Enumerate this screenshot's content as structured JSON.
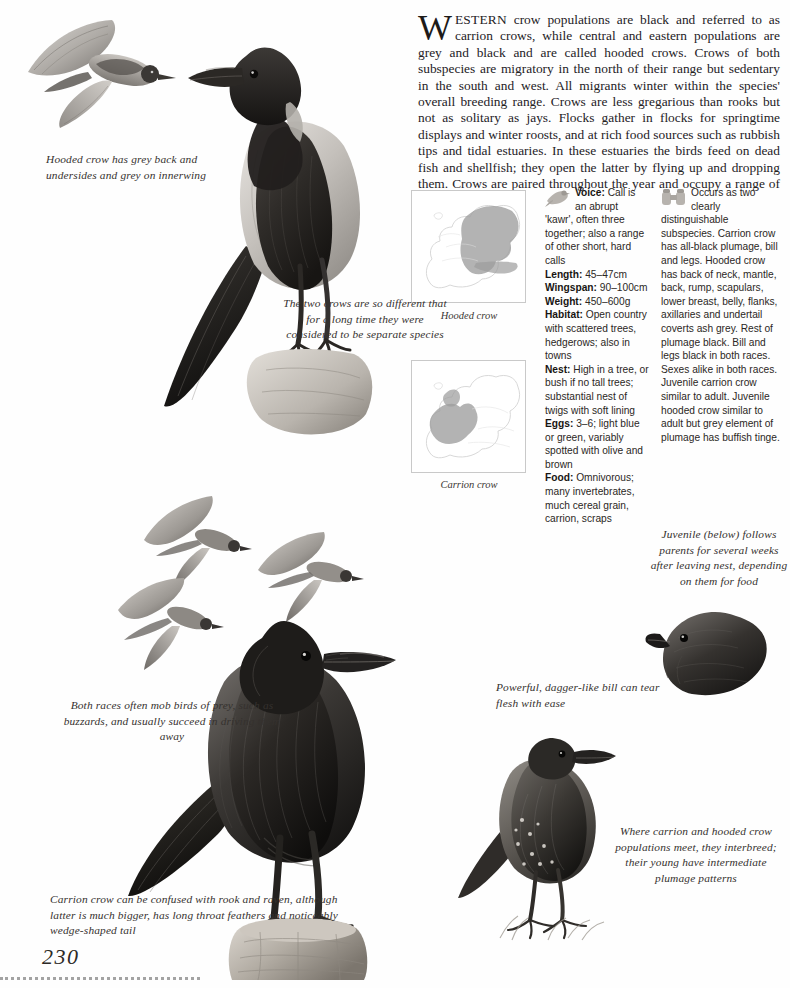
{
  "page": {
    "number": "230",
    "intro": {
      "dropcap": "W",
      "smallcaps": "ESTERN",
      "body": " crow populations are black and referred to as carrion crows, while central and eastern populations are grey and black and are called hooded crows. Crows of both subspecies are migratory in the north of their range but sedentary in the south and west. All migrants winter within the species' overall breeding range. Crows are less gregarious than rooks but not as solitary as jays. Flocks gather in flocks for springtime displays and winter roosts, and at rich food sources such as rubbish tips and tidal estuaries. In these estuaries the birds feed on dead fish and shellfish; they open the latter by flying up and dropping them. Crows are paired throughout the year and occupy a range of around 53 hectares."
    }
  },
  "maps": {
    "hooded": {
      "caption": "Hooded crow",
      "icon": "europe-map-hooded"
    },
    "carrion": {
      "caption": "Carrion crow",
      "icon": "europe-map-carrion"
    }
  },
  "factfile": {
    "left_icon": "bird-silhouette-icon",
    "right_icon": "binoculars-icon",
    "left_column": [
      {
        "label": "Voice:",
        "text": " Call is an abrupt 'kawr', often three together; also a range of other short, hard calls"
      },
      {
        "label": "Length:",
        "text": " 45–47cm"
      },
      {
        "label": "Wingspan:",
        "text": " 90–100cm"
      },
      {
        "label": "Weight:",
        "text": " 450–600g"
      },
      {
        "label": "Habitat:",
        "text": " Open country with scattered trees, hedgerows; also in towns"
      },
      {
        "label": "Nest:",
        "text": " High in a tree, or bush if no tall trees; substantial nest of twigs with soft lining"
      },
      {
        "label": "Eggs:",
        "text": " 3–6; light blue or green, variably spotted with olive and brown"
      },
      {
        "label": "Food:",
        "text": " Omnivorous; many invertebrates, much cereal grain, carrion, scraps"
      }
    ],
    "right_column_text": "Occurs as two clearly distinguishable subspecies. Carrion crow has all-black plumage, bill and legs. Hooded crow has back of neck, mantle, back, rump, scapulars, lower breast, belly, flanks, axillaries and undertail coverts ash grey. Rest of plumage black. Bill and legs black in both races. Sexes alike in both races. Juvenile carrion crow similar to adult. Juvenile hooded crow similar to adult but grey element of plumage has buffish tinge."
  },
  "annotations": {
    "hooded_grey": "Hooded crow has grey back and undersides and grey on innerwing",
    "two_crows": "The two crows are so different that for a long time they were considered to be separate species",
    "mob": "Both races often mob birds of prey, such as buzzards, and usually succeed in driving them away",
    "bill": "Powerful, dagger-like bill can tear flesh with ease",
    "juvenile": "Juvenile (below) follows parents for several weeks after leaving nest, depending on them for food",
    "interbreed": "Where carrion and hooded crow populations meet, they interbreed; their young have intermediate plumage patterns",
    "confused": "Carrion crow can be confused with rook and raven, although latter is much bigger, has long throat feathers and noticeably wedge-shaped tail"
  },
  "illustrations": {
    "hooded_crow_flying": "hooded-crow-in-flight-illustration",
    "hooded_crow_perched": "hooded-crow-perched-illustration",
    "crows_mobbing": "crows-mobbing-flight-illustration",
    "carrion_crow_perched": "carrion-crow-perched-illustration",
    "crow_head": "crow-head-closeup-illustration",
    "juvenile_crow": "juvenile-crow-illustration"
  },
  "colors": {
    "ink": "#24211f",
    "annotation": "#35312e",
    "map_outline": "#c9c9c9",
    "map_range_fill": "#9b9b9b",
    "plumage_black": "#2a2724",
    "plumage_grey": "#b9b5b0"
  }
}
